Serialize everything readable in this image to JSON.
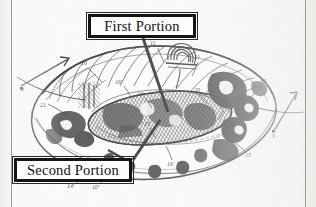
{
  "figure": {
    "kind": "patent-line-drawing",
    "background_color": "#fbfbfa",
    "ink_color": "#1a1a1a",
    "frame": {
      "left_rule_color": "#9d9d9a",
      "right_rule_color": "#9d9d9a"
    },
    "callouts": [
      {
        "id": "first-portion",
        "label": "First Portion",
        "box": {
          "x": 88,
          "y": 14,
          "w": 108,
          "h": 24
        },
        "leader": {
          "from_x": 143,
          "from_y": 38,
          "to_x": 168,
          "to_y": 112
        },
        "border_color": "#151515",
        "text_color": "#111111"
      },
      {
        "id": "second-portion",
        "label": "Second Portion",
        "box": {
          "x": 14,
          "y": 158,
          "w": 118,
          "h": 24
        },
        "leader": {
          "from_x": 132,
          "from_y": 162,
          "to_x": 129,
          "to_y": 122
        },
        "border_color": "#151515",
        "text_color": "#111111"
      }
    ],
    "reference_numerals": [
      {
        "text": "8",
        "x": 23,
        "y": 89
      },
      {
        "text": "21",
        "x": 43,
        "y": 105
      },
      {
        "text": "16",
        "x": 84,
        "y": 63
      },
      {
        "text": "16'",
        "x": 118,
        "y": 82
      },
      {
        "text": "16",
        "x": 140,
        "y": 94
      },
      {
        "text": "11",
        "x": 152,
        "y": 43
      },
      {
        "text": "21",
        "x": 196,
        "y": 57
      },
      {
        "text": "20",
        "x": 196,
        "y": 90
      },
      {
        "text": "17",
        "x": 222,
        "y": 107
      },
      {
        "text": "19",
        "x": 262,
        "y": 81
      },
      {
        "text": "15",
        "x": 146,
        "y": 124
      },
      {
        "text": "16'",
        "x": 170,
        "y": 164
      },
      {
        "text": "13",
        "x": 247,
        "y": 155
      },
      {
        "text": "14'",
        "x": 70,
        "y": 186
      },
      {
        "text": "10'",
        "x": 95,
        "y": 187
      }
    ],
    "axis_arrows": [
      {
        "id": "left-arrow",
        "label": "8",
        "tip_x": 68,
        "tip_y": 59,
        "tail_x": 21,
        "tail_y": 86
      },
      {
        "id": "right-arrow",
        "label": "9",
        "tip_x": 295,
        "tip_y": 95,
        "tail_x": 275,
        "tail_y": 131
      }
    ]
  }
}
